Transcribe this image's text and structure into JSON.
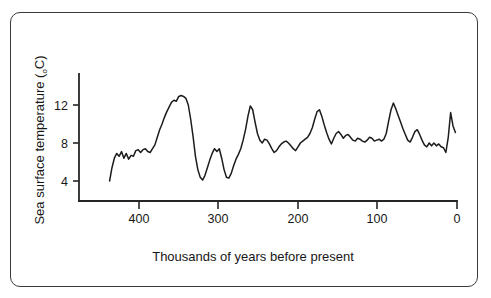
{
  "figure": {
    "border_color": "#3a3a3a",
    "background": "#ffffff"
  },
  "axes": {
    "y_title_main": "Sea surface temperature (",
    "y_title_degree": "o",
    "y_title_unit": "C)",
    "x_title": "Thousands of years before present",
    "y_ticks": [
      "12",
      "8",
      "4"
    ],
    "x_ticks": [
      "400",
      "300",
      "200",
      "100",
      "0"
    ],
    "line_color": "#262626"
  },
  "chart_data": {
    "type": "line",
    "title": "",
    "xlabel": "Thousands of years before present",
    "ylabel": "Sea surface temperature (oC)",
    "xlim": [
      440,
      0
    ],
    "ylim": [
      2.6,
      14.2
    ],
    "x_reversed": true,
    "grid": false,
    "legend": "none",
    "y_tick_values": [
      12,
      8,
      4
    ],
    "x_tick_values": [
      400,
      300,
      200,
      100,
      0
    ],
    "series": [
      {
        "name": "Sea surface temperature",
        "color": "#1c1c1c",
        "x": [
          437,
          434,
          431,
          428,
          425,
          422,
          419,
          416,
          413,
          410,
          407,
          404,
          401,
          398,
          395,
          392,
          389,
          386,
          383,
          380,
          377,
          374,
          371,
          368,
          365,
          362,
          359,
          356,
          353,
          350,
          347,
          344,
          341,
          338,
          335,
          332,
          329,
          326,
          323,
          320,
          317,
          314,
          311,
          308,
          305,
          302,
          299,
          296,
          293,
          290,
          287,
          284,
          281,
          278,
          275,
          272,
          269,
          266,
          263,
          260,
          257,
          254,
          251,
          248,
          245,
          242,
          239,
          236,
          233,
          230,
          227,
          224,
          221,
          218,
          215,
          212,
          209,
          206,
          203,
          200,
          197,
          194,
          191,
          188,
          185,
          182,
          179,
          176,
          173,
          170,
          167,
          164,
          161,
          158,
          155,
          152,
          149,
          146,
          143,
          140,
          137,
          134,
          131,
          128,
          125,
          122,
          119,
          116,
          113,
          110,
          107,
          104,
          101,
          98,
          95,
          92,
          89,
          86,
          83,
          80,
          77,
          74,
          71,
          68,
          65,
          62,
          59,
          56,
          53,
          50,
          47,
          44,
          41,
          38,
          35,
          32,
          29,
          26,
          23,
          20,
          17,
          14,
          11,
          8,
          5,
          2
        ],
        "y": [
          4.0,
          5.4,
          6.4,
          6.9,
          6.6,
          7.1,
          6.4,
          6.9,
          6.3,
          6.7,
          6.6,
          7.2,
          7.3,
          7.0,
          7.3,
          7.4,
          7.1,
          7.0,
          7.4,
          7.8,
          8.6,
          9.4,
          10.0,
          10.7,
          11.3,
          11.8,
          12.3,
          12.5,
          12.4,
          12.9,
          13.0,
          12.9,
          12.7,
          12.0,
          10.5,
          8.7,
          6.6,
          5.2,
          4.4,
          4.1,
          4.6,
          5.4,
          6.2,
          6.9,
          7.4,
          7.1,
          7.4,
          6.4,
          5.2,
          4.4,
          4.3,
          4.8,
          5.6,
          6.3,
          6.8,
          7.4,
          8.3,
          9.4,
          10.8,
          11.9,
          11.5,
          10.2,
          9.0,
          8.3,
          8.0,
          8.4,
          8.3,
          7.9,
          7.4,
          7.0,
          7.2,
          7.6,
          7.9,
          8.1,
          8.2,
          8.0,
          7.7,
          7.4,
          7.2,
          7.6,
          8.0,
          8.2,
          8.4,
          8.6,
          9.0,
          9.6,
          10.5,
          11.3,
          11.5,
          10.8,
          9.9,
          9.1,
          8.4,
          7.9,
          8.5,
          9.0,
          9.2,
          8.9,
          8.5,
          8.8,
          8.9,
          8.6,
          8.3,
          8.2,
          8.5,
          8.4,
          8.2,
          8.1,
          8.3,
          8.6,
          8.5,
          8.2,
          8.3,
          8.4,
          8.2,
          8.4,
          9.0,
          10.3,
          11.5,
          12.2,
          11.6,
          10.9,
          10.2,
          9.5,
          8.9,
          8.3,
          8.1,
          8.6,
          9.2,
          9.4,
          8.9,
          8.3,
          7.8,
          7.6,
          8.0,
          7.7,
          8.0,
          7.7,
          7.9,
          7.6,
          7.5,
          7.0,
          8.6,
          11.2,
          9.8,
          9.1
        ]
      }
    ]
  }
}
